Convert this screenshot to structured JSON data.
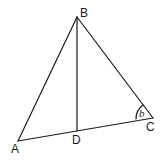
{
  "diagram": {
    "type": "triangle",
    "points": {
      "A": {
        "label": "A",
        "x": 18,
        "y": 141
      },
      "B": {
        "label": "B",
        "x": 77,
        "y": 17
      },
      "C": {
        "label": "C",
        "x": 153,
        "y": 118
      },
      "D": {
        "label": "D",
        "x": 77,
        "y": 131
      }
    },
    "segments": [
      "AB",
      "BC",
      "CA",
      "BD"
    ],
    "angle": {
      "vertex": "C",
      "label": "b"
    }
  }
}
